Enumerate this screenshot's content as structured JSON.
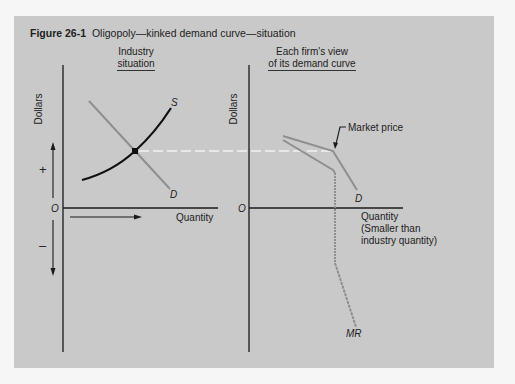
{
  "figure": {
    "number": "Figure 26-1",
    "title": "Oligopoly—kinked demand curve—situation"
  },
  "left_panel": {
    "title_line1": "Industry",
    "title_line2": "situation",
    "y_axis_label": "Dollars",
    "x_axis_label": "Quantity",
    "origin_label": "O",
    "plus_label": "+",
    "minus_label": "–",
    "supply_label": "S",
    "demand_label": "D"
  },
  "right_panel": {
    "title_line1": "Each firm's view",
    "title_line2": "of its demand curve",
    "y_axis_label": "Dollars",
    "x_axis_label_line1": "Quantity",
    "x_axis_label_line2": "(Smaller than",
    "x_axis_label_line3": "industry quantity)",
    "origin_label": "O",
    "market_price_label": "Market price",
    "demand_label": "D",
    "mr_label": "MR"
  },
  "colors": {
    "background": "#c9c9c9",
    "axis": "#1a1a1a",
    "demand_line": "#8f8f8f",
    "supply_curve": "#111111",
    "dashed_price_line": "#f2f2f2"
  }
}
